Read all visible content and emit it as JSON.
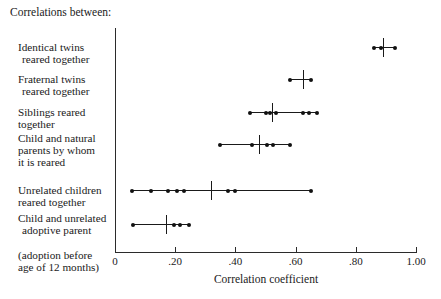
{
  "caption": "Correlations between:",
  "axis": {
    "title": "Correlation coefficient",
    "ticks": [
      {
        "value": 0,
        "label": "0"
      },
      {
        "value": 0.2,
        "label": ".20"
      },
      {
        "value": 0.4,
        "label": ".40"
      },
      {
        "value": 0.6,
        "label": ".60"
      },
      {
        "value": 0.8,
        "label": ".80"
      },
      {
        "value": 1.0,
        "label": "1.00"
      }
    ]
  },
  "rows": [
    {
      "label_lines": [
        "Identical twins",
        "reared together"
      ],
      "label_html": "Identical twins<br><span class=\"ind\">reared together</span>"
    },
    {
      "label_lines": [
        "Fraternal twins",
        "reared together"
      ],
      "label_html": "Fraternal twins<br><span class=\"ind\">reared together</span>"
    },
    {
      "label_lines": [
        "Siblings reared",
        "together"
      ],
      "label_html": "Siblings reared<br>together"
    },
    {
      "label_lines": [
        "Child and natural",
        "parents by whom",
        "it is reared"
      ],
      "label_html": "Child and natural<br>parents by whom<br>it is reared"
    },
    {
      "label_lines": [
        "Unrelated children",
        "reared together"
      ],
      "label_html": "Unrelated children<br>reared together"
    },
    {
      "label_lines": [
        "Child and unrelated",
        "adoptive parent",
        "(adoption before",
        "age of 12 months)"
      ],
      "label_html": "Child and unrelated<br><span class=\"ind\">adoptive parent</span><br>(adoption before<br>age of 12 months)"
    }
  ],
  "chart_data": {
    "type": "scatter",
    "title": "",
    "xlabel": "Correlation coefficient",
    "ylabel": "",
    "xlim": [
      0,
      1.0
    ],
    "xticks": [
      0,
      0.2,
      0.4,
      0.6,
      0.8,
      1.0
    ],
    "xticklabels": [
      "0",
      ".20",
      ".40",
      ".60",
      ".80",
      "1.00"
    ],
    "grid": false,
    "legend": "none",
    "categories": [
      "Identical twins reared together",
      "Fraternal twins reared together",
      "Siblings reared together",
      "Child and natural parents by whom it is reared",
      "Unrelated children reared together",
      "Child and unrelated adoptive parent (adoption before age of 12 months)"
    ],
    "series": [
      {
        "name": "Identical twins reared together",
        "range": [
          0.86,
          0.93
        ],
        "median": 0.89,
        "points": [
          0.86,
          0.885,
          0.93
        ]
      },
      {
        "name": "Fraternal twins reared together",
        "range": [
          0.58,
          0.65
        ],
        "median": 0.625,
        "points": [
          0.58,
          0.65
        ]
      },
      {
        "name": "Siblings reared together",
        "range": [
          0.45,
          0.67
        ],
        "median": 0.52,
        "points": [
          0.45,
          0.5,
          0.515,
          0.535,
          0.625,
          0.645,
          0.67
        ]
      },
      {
        "name": "Child and natural parents by whom it is reared",
        "range": [
          0.35,
          0.58
        ],
        "median": 0.48,
        "points": [
          0.35,
          0.455,
          0.505,
          0.525,
          0.58
        ]
      },
      {
        "name": "Unrelated children reared together",
        "range": [
          0.055,
          0.65
        ],
        "median": 0.32,
        "points": [
          0.055,
          0.12,
          0.175,
          0.205,
          0.23,
          0.375,
          0.4,
          0.65
        ]
      },
      {
        "name": "Child and unrelated adoptive parent (adoption before age of 12 months)",
        "range": [
          0.06,
          0.245
        ],
        "median": 0.17,
        "points": [
          0.06,
          0.195,
          0.215,
          0.245
        ]
      }
    ]
  },
  "layout": {
    "axis_left_px": 115,
    "axis_right_px": 416,
    "row_y_px": [
      47,
      79,
      112,
      144,
      190,
      224
    ],
    "label_top_px": [
      41,
      73,
      106,
      132,
      184,
      212
    ]
  }
}
